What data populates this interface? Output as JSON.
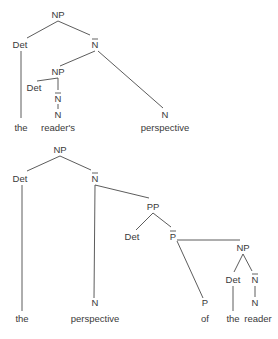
{
  "diagram": {
    "type": "syntax-tree",
    "colors": {
      "line": "#4a4a4a",
      "text": "#3a3a3a",
      "background": "#ffffff"
    },
    "trees": [
      {
        "id": "tree-1",
        "phrase": "the reader's perspective",
        "nodes": [
          {
            "id": "t1-np",
            "label": "NP",
            "bar": false,
            "x": 58,
            "y": 18
          },
          {
            "id": "t1-det",
            "label": "Det",
            "bar": false,
            "x": 20,
            "y": 48
          },
          {
            "id": "t1-nbar",
            "label": "N",
            "bar": true,
            "x": 95,
            "y": 48
          },
          {
            "id": "t1-np2",
            "label": "NP",
            "bar": false,
            "x": 58,
            "y": 75
          },
          {
            "id": "t1-det2",
            "label": "Det",
            "bar": false,
            "x": 34,
            "y": 91
          },
          {
            "id": "t1-nbar2",
            "label": "N",
            "bar": true,
            "x": 58,
            "y": 102
          },
          {
            "id": "t1-n2",
            "label": "N",
            "bar": false,
            "x": 58,
            "y": 118
          },
          {
            "id": "t1-n",
            "label": "N",
            "bar": false,
            "x": 165,
            "y": 118
          },
          {
            "id": "t1-w-the",
            "label": "the",
            "bar": false,
            "x": 21,
            "y": 131,
            "word": true
          },
          {
            "id": "t1-w-readers",
            "label": "reader's",
            "bar": false,
            "x": 58,
            "y": 131,
            "word": true
          },
          {
            "id": "t1-w-perspective",
            "label": "perspective",
            "bar": false,
            "x": 165,
            "y": 131,
            "word": true
          }
        ],
        "edges": [
          {
            "x1": 58,
            "y1": 21,
            "x2": 27,
            "y2": 38
          },
          {
            "x1": 58,
            "y1": 21,
            "x2": 90,
            "y2": 35
          },
          {
            "x1": 21,
            "y1": 51,
            "x2": 21,
            "y2": 118
          },
          {
            "x1": 95,
            "y1": 51,
            "x2": 60,
            "y2": 66
          },
          {
            "x1": 98,
            "y1": 51,
            "x2": 163,
            "y2": 108
          },
          {
            "x1": 58,
            "y1": 78,
            "x2": 37,
            "y2": 81
          },
          {
            "x1": 58,
            "y1": 78,
            "x2": 58,
            "y2": 90
          },
          {
            "x1": 58,
            "y1": 104,
            "x2": 58,
            "y2": 109
          }
        ]
      },
      {
        "id": "tree-2",
        "phrase": "the perspective of the reader",
        "nodes": [
          {
            "id": "t2-np",
            "label": "NP",
            "bar": false,
            "x": 60,
            "y": 153
          },
          {
            "id": "t2-det",
            "label": "Det",
            "bar": false,
            "x": 20,
            "y": 182
          },
          {
            "id": "t2-nbar",
            "label": "N",
            "bar": true,
            "x": 95,
            "y": 182
          },
          {
            "id": "t2-pp",
            "label": "PP",
            "bar": false,
            "x": 153,
            "y": 210
          },
          {
            "id": "t2-det2",
            "label": "Det",
            "bar": false,
            "x": 132,
            "y": 240
          },
          {
            "id": "t2-pbar",
            "label": "P",
            "bar": true,
            "x": 173,
            "y": 240
          },
          {
            "id": "t2-np2",
            "label": "NP",
            "bar": false,
            "x": 243,
            "y": 251
          },
          {
            "id": "t2-det3",
            "label": "Det",
            "bar": false,
            "x": 233,
            "y": 283
          },
          {
            "id": "t2-nbar2",
            "label": "N",
            "bar": true,
            "x": 255,
            "y": 283
          },
          {
            "id": "t2-n",
            "label": "N",
            "bar": false,
            "x": 95,
            "y": 306
          },
          {
            "id": "t2-p",
            "label": "P",
            "bar": false,
            "x": 205,
            "y": 306
          },
          {
            "id": "t2-n2",
            "label": "N",
            "bar": false,
            "x": 255,
            "y": 306
          },
          {
            "id": "t2-w-the",
            "label": "the",
            "bar": false,
            "x": 22,
            "y": 322,
            "word": true
          },
          {
            "id": "t2-w-perspective",
            "label": "perspective",
            "bar": false,
            "x": 95,
            "y": 322,
            "word": true
          },
          {
            "id": "t2-w-of",
            "label": "of",
            "bar": false,
            "x": 205,
            "y": 322,
            "word": true
          },
          {
            "id": "t2-w-the2",
            "label": "the",
            "bar": false,
            "x": 233,
            "y": 322,
            "word": true
          },
          {
            "id": "t2-w-reader",
            "label": "reader",
            "bar": false,
            "x": 258,
            "y": 322,
            "word": true
          }
        ],
        "edges": [
          {
            "x1": 60,
            "y1": 156,
            "x2": 27,
            "y2": 171
          },
          {
            "x1": 60,
            "y1": 156,
            "x2": 91,
            "y2": 170
          },
          {
            "x1": 22,
            "y1": 185,
            "x2": 22,
            "y2": 311
          },
          {
            "x1": 95,
            "y1": 185,
            "x2": 94,
            "y2": 298
          },
          {
            "x1": 95,
            "y1": 185,
            "x2": 149,
            "y2": 198
          },
          {
            "x1": 153,
            "y1": 213,
            "x2": 136,
            "y2": 230
          },
          {
            "x1": 153,
            "y1": 213,
            "x2": 171,
            "y2": 227
          },
          {
            "x1": 177,
            "y1": 240,
            "x2": 240,
            "y2": 240
          },
          {
            "x1": 177,
            "y1": 241,
            "x2": 203,
            "y2": 298
          },
          {
            "x1": 243,
            "y1": 254,
            "x2": 234,
            "y2": 272
          },
          {
            "x1": 243,
            "y1": 254,
            "x2": 252,
            "y2": 271
          },
          {
            "x1": 233,
            "y1": 286,
            "x2": 233,
            "y2": 311
          },
          {
            "x1": 255,
            "y1": 286,
            "x2": 255,
            "y2": 297
          }
        ]
      }
    ]
  }
}
